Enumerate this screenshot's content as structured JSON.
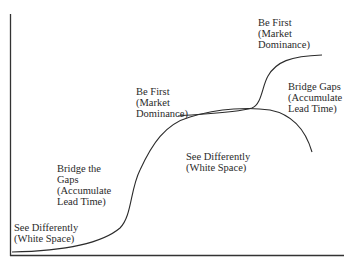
{
  "diagram": {
    "type": "double-s-curve",
    "colors": {
      "line": "#2b2b2b",
      "text": "#2a2a2a",
      "background": "#ffffff"
    },
    "labels": {
      "see_differently_1": {
        "lines": [
          "See Differently",
          "(White Space)"
        ]
      },
      "bridge_the_gaps": {
        "lines": [
          "Bridge the",
          "Gaps",
          "(Accumulate",
          "Lead Time)"
        ]
      },
      "be_first_1": {
        "lines": [
          "Be First",
          "(Market",
          "Dominance)"
        ]
      },
      "see_differently_2": {
        "lines": [
          "See Differently",
          "(White Space)"
        ]
      },
      "be_first_2": {
        "lines": [
          "Be First",
          "(Market",
          "Dominance)"
        ]
      },
      "bridge_gaps": {
        "lines": [
          "Bridge Gaps",
          "(Accumulate",
          "Lead Time)"
        ]
      }
    }
  }
}
